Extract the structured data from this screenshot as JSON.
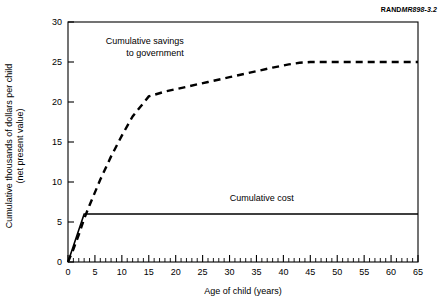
{
  "figure": {
    "source_id_prefix": "RAND",
    "source_id_number": "MR898-3.2"
  },
  "chart_data": {
    "type": "line",
    "title": "",
    "xlabel": "Age of child (years)",
    "ylabel": "Cumulative thousands of dollars per child",
    "ylabel_line2": "(net present value)",
    "xlim": [
      0,
      65
    ],
    "ylim": [
      0,
      30
    ],
    "xticks": [
      0,
      5,
      10,
      15,
      20,
      25,
      30,
      35,
      40,
      45,
      50,
      55,
      60,
      65
    ],
    "xticklabels": [
      "0",
      "5",
      "10",
      "15",
      "20",
      "25",
      "30",
      "35",
      "40",
      "45",
      "50",
      "55",
      "60",
      "65"
    ],
    "xminor_tick_interval": 1,
    "yticks": [
      0,
      5,
      10,
      15,
      20,
      25,
      30
    ],
    "yticklabels": [
      "0",
      "5",
      "10",
      "15",
      "20",
      "25",
      "30"
    ],
    "grid": false,
    "frame": true,
    "legend": "none",
    "annotations": [
      {
        "name": "savings-annotation",
        "line1": "Cumulative savings",
        "line2": "to government",
        "x": 21.5,
        "y": 27.2
      },
      {
        "name": "cost-annotation",
        "line1": "Cumulative cost",
        "x": 36.0,
        "y": 7.6
      }
    ],
    "series": [
      {
        "name": "Cumulative savings to government",
        "style": "dashed",
        "color": "#000000",
        "x": [
          0,
          1,
          2,
          3,
          4,
          6,
          8,
          10,
          12,
          15,
          18,
          22,
          26,
          30,
          34,
          38,
          41,
          43,
          45,
          50,
          55,
          60,
          65
        ],
        "values": [
          0,
          1.6,
          3.4,
          5.4,
          7.1,
          10.3,
          13.2,
          15.8,
          18.2,
          20.7,
          21.3,
          21.9,
          22.5,
          23.1,
          23.7,
          24.3,
          24.7,
          24.9,
          25.0,
          25.0,
          25.0,
          25.0,
          25.0
        ]
      },
      {
        "name": "Cumulative cost",
        "style": "solid",
        "color": "#000000",
        "x": [
          0,
          1,
          2,
          3,
          65
        ],
        "values": [
          0,
          2.0,
          4.0,
          6.0,
          6.0
        ]
      }
    ]
  }
}
